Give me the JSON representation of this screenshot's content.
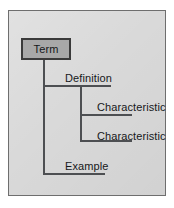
{
  "diagram": {
    "background_color": "#d9d9d9",
    "border_color": "#6e6e6e",
    "line_color": "#4d4f52",
    "text_color": "#16181a",
    "root": {
      "label": "Term",
      "fill_color": "#a8a8a8",
      "border_color": "#3a3a3a"
    },
    "branches": [
      {
        "label": "Definition",
        "level": 1,
        "children": [
          {
            "label": "Characteristic",
            "level": 2
          },
          {
            "label": "Characteristic",
            "level": 2
          }
        ]
      },
      {
        "label": "Example",
        "level": 1,
        "children": []
      }
    ],
    "connectors": [
      {
        "name": "trunk-main",
        "orientation": "vertical"
      },
      {
        "name": "branch-definition",
        "orientation": "horizontal"
      },
      {
        "name": "trunk-sub",
        "orientation": "vertical"
      },
      {
        "name": "branch-characteristic-1",
        "orientation": "horizontal"
      },
      {
        "name": "branch-characteristic-2",
        "orientation": "horizontal"
      },
      {
        "name": "branch-example",
        "orientation": "horizontal"
      }
    ]
  }
}
